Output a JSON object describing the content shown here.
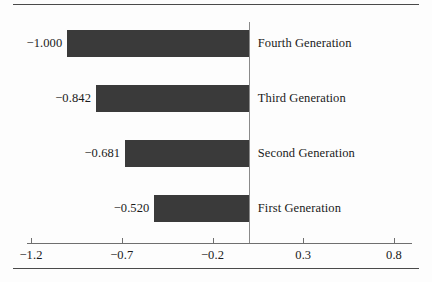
{
  "chart_data": {
    "type": "bar",
    "orientation": "horizontal",
    "title": "",
    "subtitle": "",
    "xlabel": "",
    "ylabel": "",
    "categories": [
      "Fourth Generation",
      "Third Generation",
      "Second Generation",
      "First Generation"
    ],
    "values": [
      -1.0,
      -0.842,
      -0.681,
      -0.52
    ],
    "value_labels": [
      "−1.000",
      "−0.842",
      "−0.681",
      "−0.520"
    ],
    "xlim": [
      -1.2,
      0.8
    ],
    "xticks": [
      -1.2,
      -0.7,
      -0.2,
      0.3,
      0.8
    ],
    "xtick_labels": [
      "−1.2",
      "−0.7",
      "−0.2",
      "0.3",
      "0.8"
    ],
    "grid": false,
    "legend": null,
    "zero_reference_line": 0,
    "bar_color": "#3a3a3a",
    "background_color": "#fdfdfd",
    "axis_color": "#6f6f6f"
  },
  "figure": {
    "top_rule": "",
    "bottom_rule": ""
  }
}
